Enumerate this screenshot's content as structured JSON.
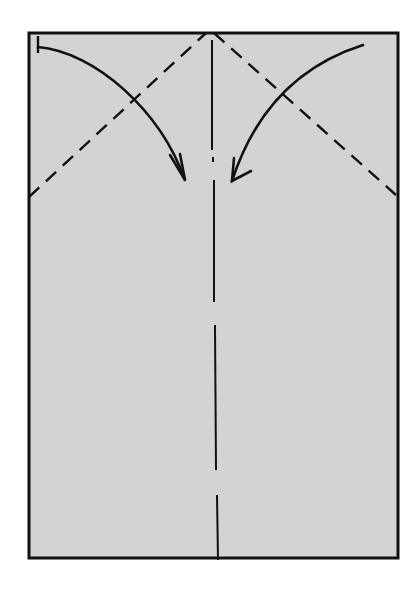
{
  "diagram": {
    "type": "origami-fold-instruction",
    "paper": {
      "fill": "#d3d3d3",
      "stroke": "#111111",
      "shape": "rectangle",
      "x": 29,
      "y": 33,
      "width": 369,
      "height": 525
    },
    "lines": {
      "valley_fold_left": {
        "style": "dashed",
        "from": [
          29,
          197
        ],
        "to": [
          206,
          33
        ]
      },
      "valley_fold_right": {
        "style": "dashed",
        "from": [
          214,
          33
        ],
        "to": [
          396,
          195
        ]
      },
      "center_crease": {
        "style": "dash-dot",
        "x": 217
      }
    },
    "arrows": [
      {
        "name": "fold-left-corner-arrow",
        "direction": "down-right",
        "from": [
          38,
          46
        ],
        "to": [
          185,
          182
        ]
      },
      {
        "name": "fold-right-corner-arrow",
        "direction": "down-left",
        "from": [
          363,
          45
        ],
        "to": [
          232,
          182
        ]
      }
    ]
  }
}
